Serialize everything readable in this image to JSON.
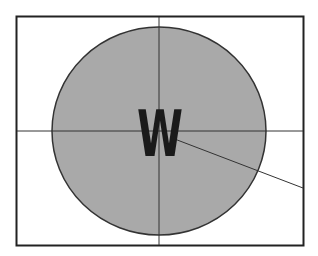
{
  "diagram": {
    "center_label": "W",
    "colors": {
      "background": "#ffffff",
      "frame": "#222222",
      "circle_fill": "#a9a9a9",
      "circle_stroke": "#333333",
      "lines": "#333333",
      "label": "#1a1a1a"
    }
  }
}
